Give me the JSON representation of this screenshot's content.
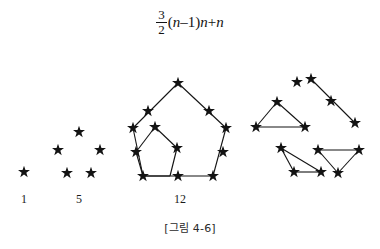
{
  "figure": {
    "caption": "[그림 4-6]",
    "formula": {
      "fraction_numerator": "3",
      "fraction_denominator": "2",
      "open_paren": "(",
      "var_n_1": "n",
      "minus": "–",
      "one": "1",
      "close_paren": ")",
      "var_n_2": "n",
      "plus": "+",
      "var_n_3": "n",
      "plain_text": "3/2 (n–1)n + n"
    },
    "ink_color": "#131313",
    "background_color": "#ffffff"
  },
  "groups": [
    {
      "id": "group-1",
      "label": "1",
      "label_x": 24,
      "label_y": 192,
      "star_count": 1,
      "stars": [
        {
          "x": 24,
          "y": 172
        }
      ],
      "edges": []
    },
    {
      "id": "group-5",
      "label": "5",
      "label_x": 79,
      "label_y": 192,
      "star_count": 5,
      "stars": [
        {
          "x": 79,
          "y": 132
        },
        {
          "x": 58,
          "y": 150
        },
        {
          "x": 100,
          "y": 150
        },
        {
          "x": 67,
          "y": 173
        },
        {
          "x": 91,
          "y": 173
        }
      ],
      "edges": []
    },
    {
      "id": "group-12",
      "label": "12",
      "label_x": 180,
      "label_y": 192,
      "star_count": 12,
      "stars": [
        {
          "x": 178,
          "y": 83
        },
        {
          "x": 148,
          "y": 111
        },
        {
          "x": 209,
          "y": 111
        },
        {
          "x": 133,
          "y": 128
        },
        {
          "x": 226,
          "y": 128
        },
        {
          "x": 136,
          "y": 152
        },
        {
          "x": 223,
          "y": 152
        },
        {
          "x": 143,
          "y": 176
        },
        {
          "x": 178,
          "y": 176
        },
        {
          "x": 213,
          "y": 176
        },
        {
          "x": 155,
          "y": 127
        },
        {
          "x": 177,
          "y": 148
        }
      ],
      "edges": [
        [
          178,
          83,
          133,
          128
        ],
        [
          178,
          83,
          226,
          128
        ],
        [
          133,
          128,
          143,
          176
        ],
        [
          226,
          128,
          213,
          176
        ],
        [
          143,
          176,
          213,
          176
        ],
        [
          155,
          127,
          177,
          148
        ],
        [
          177,
          148,
          170,
          176
        ],
        [
          170,
          176,
          143,
          176
        ],
        [
          143,
          176,
          136,
          152
        ],
        [
          136,
          152,
          155,
          127
        ]
      ]
    },
    {
      "id": "group-decomposed",
      "label": "",
      "star_count": 12,
      "stars": [
        {
          "x": 297,
          "y": 82
        },
        {
          "x": 311,
          "y": 79
        },
        {
          "x": 331,
          "y": 101
        },
        {
          "x": 355,
          "y": 123
        },
        {
          "x": 277,
          "y": 102
        },
        {
          "x": 256,
          "y": 127
        },
        {
          "x": 305,
          "y": 127
        },
        {
          "x": 281,
          "y": 148
        },
        {
          "x": 294,
          "y": 172
        },
        {
          "x": 321,
          "y": 172
        },
        {
          "x": 318,
          "y": 150
        },
        {
          "x": 359,
          "y": 150
        },
        {
          "x": 338,
          "y": 173
        }
      ],
      "edges": [
        [
          311,
          79,
          355,
          123
        ],
        [
          277,
          102,
          256,
          127
        ],
        [
          277,
          102,
          305,
          127
        ],
        [
          256,
          127,
          305,
          127
        ],
        [
          281,
          148,
          294,
          172
        ],
        [
          281,
          148,
          321,
          172
        ],
        [
          294,
          172,
          321,
          172
        ],
        [
          318,
          150,
          359,
          150
        ],
        [
          318,
          150,
          338,
          173
        ],
        [
          359,
          150,
          338,
          173
        ]
      ]
    }
  ]
}
